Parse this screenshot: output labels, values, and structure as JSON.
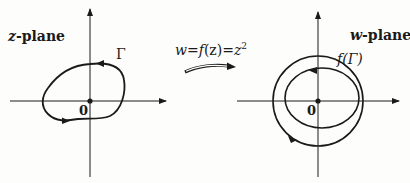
{
  "diagram": {
    "type": "complex-mapping",
    "mapping": {
      "label": "w = f(z) = z²",
      "lhs": "w",
      "eq1": "=",
      "func": "f",
      "arg": "(z)",
      "eq2": "=",
      "rhs_base": "z",
      "rhs_exp": "2"
    },
    "left_plane": {
      "title_var": "z",
      "title_rest": "-plane",
      "curve_label": "Γ",
      "origin_label": "0"
    },
    "right_plane": {
      "title_var": "w",
      "title_rest": "-plane",
      "curve_label": "f(Γ)",
      "origin_label": "0"
    },
    "colors": {
      "ink": "#1a1a1a",
      "background": "#fdfdfb"
    }
  }
}
